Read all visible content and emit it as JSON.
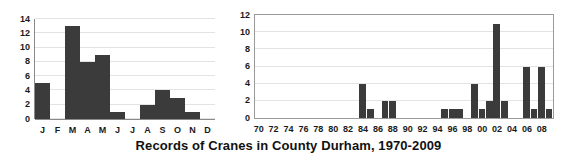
{
  "figure": {
    "title": "Records of Cranes in County Durham, 1970-2009",
    "bar_color": "#3b3b3b"
  },
  "chart_data": [
    {
      "id": "monthly",
      "type": "bar",
      "title": "",
      "xlabel": "",
      "ylabel": "",
      "categories": [
        "J",
        "F",
        "M",
        "A",
        "M",
        "J",
        "J",
        "A",
        "S",
        "O",
        "N",
        "D"
      ],
      "category_names": [
        "January",
        "February",
        "March",
        "April",
        "May",
        "June",
        "July",
        "August",
        "September",
        "October",
        "November",
        "December"
      ],
      "values": [
        5,
        0,
        13,
        8,
        9,
        1,
        0,
        2,
        4,
        3,
        1,
        0
      ],
      "ylim": [
        0,
        14
      ],
      "yticks": [
        0,
        2,
        4,
        6,
        8,
        10,
        12,
        14
      ],
      "grid": true,
      "legend": "none"
    },
    {
      "id": "yearly",
      "type": "bar",
      "title": "",
      "xlabel": "",
      "ylabel": "",
      "x": [
        1970,
        1971,
        1972,
        1973,
        1974,
        1975,
        1976,
        1977,
        1978,
        1979,
        1980,
        1981,
        1982,
        1983,
        1984,
        1985,
        1986,
        1987,
        1988,
        1989,
        1990,
        1991,
        1992,
        1993,
        1994,
        1995,
        1996,
        1997,
        1998,
        1999,
        2000,
        2001,
        2002,
        2003,
        2004,
        2005,
        2006,
        2007,
        2008,
        2009
      ],
      "values": [
        0,
        0,
        0,
        0,
        0,
        0,
        0,
        0,
        0,
        0,
        0,
        0,
        0,
        0,
        4,
        1,
        0,
        2,
        2,
        0,
        0,
        0,
        0,
        0,
        0,
        1,
        1,
        1,
        0,
        4,
        1,
        2,
        11,
        2,
        0,
        0,
        6,
        1,
        6,
        1
      ],
      "xticklabels": [
        "70",
        "72",
        "74",
        "76",
        "78",
        "80",
        "82",
        "84",
        "86",
        "88",
        "90",
        "92",
        "94",
        "96",
        "98",
        "00",
        "02",
        "04",
        "06",
        "08"
      ],
      "xtick_values": [
        1970,
        1972,
        1974,
        1976,
        1978,
        1980,
        1982,
        1984,
        1986,
        1988,
        1990,
        1992,
        1994,
        1996,
        1998,
        2000,
        2002,
        2004,
        2006,
        2008
      ],
      "ylim": [
        0,
        12
      ],
      "yticks": [
        0,
        2,
        4,
        6,
        8,
        10,
        12
      ],
      "grid": true,
      "legend": "none"
    }
  ]
}
